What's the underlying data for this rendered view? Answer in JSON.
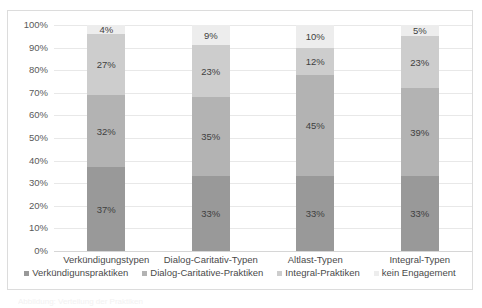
{
  "chart_data": {
    "type": "bar",
    "subtype": "stacked-100-percent",
    "title": "",
    "xlabel": "",
    "ylabel": "",
    "ylim": [
      0,
      100
    ],
    "grid": true,
    "legend_position": "bottom",
    "categories": [
      "Verkündigungstypen",
      "Dialog-Caritativ-Typen",
      "Altlast-Typen",
      "Integral-Typen"
    ],
    "y_ticks": [
      "0%",
      "10%",
      "20%",
      "30%",
      "40%",
      "50%",
      "60%",
      "70%",
      "80%",
      "90%",
      "100%"
    ],
    "y_tick_values": [
      0,
      10,
      20,
      30,
      40,
      50,
      60,
      70,
      80,
      90,
      100
    ],
    "series": [
      {
        "name": "Verkündigunspraktiken",
        "color": "#999999",
        "values": [
          37,
          33,
          33,
          33
        ],
        "labels": [
          "37%",
          "33%",
          "33%",
          "33%"
        ]
      },
      {
        "name": "Dialog-Caritative-Praktiken",
        "color": "#b3b3b3",
        "values": [
          32,
          35,
          45,
          39
        ],
        "labels": [
          "32%",
          "35%",
          "45%",
          "39%"
        ]
      },
      {
        "name": "Integral-Praktiken",
        "color": "#cdcdcd",
        "values": [
          27,
          23,
          12,
          23
        ],
        "labels": [
          "27%",
          "23%",
          "12%",
          "23%"
        ]
      },
      {
        "name": "kein Engagement",
        "color": "#ededed",
        "values": [
          4,
          9,
          10,
          5
        ],
        "labels": [
          "4%",
          "9%",
          "10%",
          "5%"
        ]
      }
    ]
  },
  "legend": {
    "items": [
      "Verkündigunspraktiken",
      "Dialog-Caritative-Praktiken",
      "Integral-Praktiken",
      "kein Engagement"
    ]
  },
  "caption_sliver": "Abbildung: Verteilung der Praktiken"
}
